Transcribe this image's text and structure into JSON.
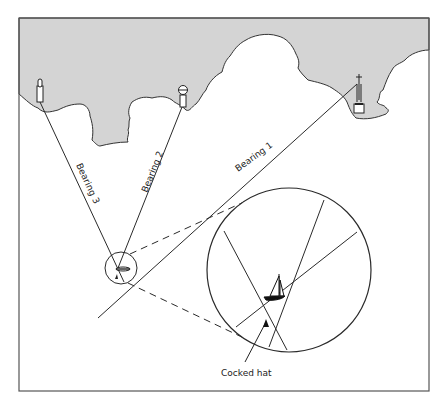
{
  "figure": {
    "labels": {
      "bearing1": "Bearing 1",
      "bearing2": "Bearing 2",
      "bearing3": "Bearing 3",
      "cocked_hat": "Cocked hat"
    },
    "landmarks": [
      {
        "id": "landmark-1",
        "kind": "beacon-post",
        "bearing": "Bearing 3"
      },
      {
        "id": "landmark-2",
        "kind": "round-top-beacon",
        "bearing": "Bearing 2"
      },
      {
        "id": "landmark-3",
        "kind": "church-spire",
        "bearing": "Bearing 1"
      }
    ],
    "colors": {
      "land": "#d4d4d4",
      "line": "#2a2a2a",
      "frame": "#555555",
      "sea": "#ffffff"
    }
  }
}
